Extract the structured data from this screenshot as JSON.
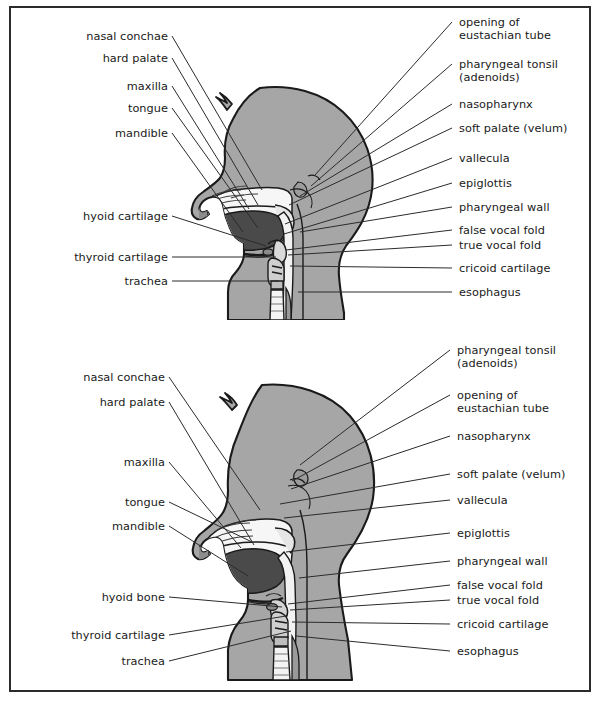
{
  "figure": {
    "type": "anatomical-diagram",
    "title_visible": false,
    "panels": [
      {
        "id": "upper-airway-rest",
        "labels_left": [
          {
            "text": "nasal conchae",
            "x": 57,
            "y": 30,
            "anchor_x": 172,
            "anchor_y": 36,
            "tip_x": 262,
            "tip_y": 190
          },
          {
            "text": "hard palate",
            "x": 80,
            "y": 52,
            "anchor_x": 172,
            "anchor_y": 58,
            "tip_x": 258,
            "tip_y": 205
          },
          {
            "text": "maxilla",
            "x": 100,
            "y": 80,
            "anchor_x": 172,
            "anchor_y": 86,
            "tip_x": 249,
            "tip_y": 209
          },
          {
            "text": "tongue",
            "x": 101,
            "y": 102,
            "anchor_x": 172,
            "anchor_y": 108,
            "tip_x": 258,
            "tip_y": 228
          },
          {
            "text": "mandible",
            "x": 89,
            "y": 127,
            "anchor_x": 172,
            "anchor_y": 133,
            "tip_x": 243,
            "tip_y": 232
          },
          {
            "text": "hyoid cartilage",
            "x": 56,
            "y": 210,
            "anchor_x": 172,
            "anchor_y": 216,
            "tip_x": 266,
            "tip_y": 246
          },
          {
            "text": "thyroid cartilage",
            "x": 44,
            "y": 251,
            "anchor_x": 172,
            "anchor_y": 257,
            "tip_x": 276,
            "tip_y": 257
          },
          {
            "text": "trachea",
            "x": 99,
            "y": 275,
            "anchor_x": 172,
            "anchor_y": 281,
            "tip_x": 279,
            "tip_y": 281
          }
        ],
        "labels_right": [
          {
            "text": "opening of\neustachian tube",
            "x": 459,
            "y": 16,
            "anchor_x": 452,
            "anchor_y": 22,
            "tip_x": 315,
            "tip_y": 175
          },
          {
            "text": "pharyngeal tonsil\n(adenoids)",
            "x": 459,
            "y": 58,
            "anchor_x": 452,
            "anchor_y": 64,
            "tip_x": 311,
            "tip_y": 186
          },
          {
            "text": "nasopharynx",
            "x": 459,
            "y": 98,
            "anchor_x": 452,
            "anchor_y": 104,
            "tip_x": 300,
            "tip_y": 196
          },
          {
            "text": "soft palate (velum)",
            "x": 459,
            "y": 122,
            "anchor_x": 452,
            "anchor_y": 128,
            "tip_x": 289,
            "tip_y": 205
          },
          {
            "text": "vallecula",
            "x": 459,
            "y": 152,
            "anchor_x": 452,
            "anchor_y": 158,
            "tip_x": 285,
            "tip_y": 224
          },
          {
            "text": "epiglottis",
            "x": 459,
            "y": 177,
            "anchor_x": 452,
            "anchor_y": 183,
            "tip_x": 284,
            "tip_y": 234
          },
          {
            "text": "pharyngeal wall",
            "x": 459,
            "y": 201,
            "anchor_x": 452,
            "anchor_y": 207,
            "tip_x": 300,
            "tip_y": 232
          },
          {
            "text": "false vocal fold",
            "x": 459,
            "y": 224,
            "anchor_x": 452,
            "anchor_y": 230,
            "tip_x": 286,
            "tip_y": 250
          },
          {
            "text": "true vocal fold",
            "x": 459,
            "y": 239,
            "anchor_x": 452,
            "anchor_y": 245,
            "tip_x": 288,
            "tip_y": 255
          },
          {
            "text": "cricoid cartilage",
            "x": 459,
            "y": 262,
            "anchor_x": 452,
            "anchor_y": 268,
            "tip_x": 290,
            "tip_y": 266
          },
          {
            "text": "esophagus",
            "x": 459,
            "y": 286,
            "anchor_x": 452,
            "anchor_y": 292,
            "tip_x": 298,
            "tip_y": 292
          }
        ]
      },
      {
        "id": "upper-airway-swallow",
        "labels_left": [
          {
            "text": "nasal conchae",
            "x": 57,
            "y": 51,
            "anchor_x": 169,
            "anchor_y": 57,
            "tip_x": 260,
            "tip_y": 190
          },
          {
            "text": "hard palate",
            "x": 72,
            "y": 76,
            "anchor_x": 169,
            "anchor_y": 82,
            "tip_x": 254,
            "tip_y": 225
          },
          {
            "text": "maxilla",
            "x": 96,
            "y": 136,
            "anchor_x": 169,
            "anchor_y": 142,
            "tip_x": 241,
            "tip_y": 228
          },
          {
            "text": "tongue",
            "x": 96,
            "y": 176,
            "anchor_x": 169,
            "anchor_y": 182,
            "tip_x": 252,
            "tip_y": 222
          },
          {
            "text": "mandible",
            "x": 84,
            "y": 200,
            "anchor_x": 169,
            "anchor_y": 206,
            "tip_x": 248,
            "tip_y": 256
          },
          {
            "text": "hyoid bone",
            "x": 76,
            "y": 271,
            "anchor_x": 169,
            "anchor_y": 277,
            "tip_x": 282,
            "tip_y": 287
          },
          {
            "text": "thyroid cartilage",
            "x": 44,
            "y": 309,
            "anchor_x": 169,
            "anchor_y": 315,
            "tip_x": 286,
            "tip_y": 296
          },
          {
            "text": "trachea",
            "x": 96,
            "y": 335,
            "anchor_x": 169,
            "anchor_y": 341,
            "tip_x": 291,
            "tip_y": 311
          }
        ],
        "labels_right": [
          {
            "text": "pharyngeal tonsil\n(adenoids)",
            "x": 457,
            "y": 24,
            "anchor_x": 450,
            "anchor_y": 30,
            "tip_x": 300,
            "tip_y": 145
          },
          {
            "text": "opening of\neustachian tube",
            "x": 457,
            "y": 69,
            "anchor_x": 450,
            "anchor_y": 75,
            "tip_x": 292,
            "tip_y": 161
          },
          {
            "text": "nasopharynx",
            "x": 457,
            "y": 110,
            "anchor_x": 450,
            "anchor_y": 116,
            "tip_x": 291,
            "tip_y": 169
          },
          {
            "text": "soft palate (velum)",
            "x": 457,
            "y": 148,
            "anchor_x": 450,
            "anchor_y": 154,
            "tip_x": 280,
            "tip_y": 184
          },
          {
            "text": "vallecula",
            "x": 457,
            "y": 174,
            "anchor_x": 450,
            "anchor_y": 180,
            "tip_x": 284,
            "tip_y": 198
          },
          {
            "text": "epiglottis",
            "x": 457,
            "y": 207,
            "anchor_x": 450,
            "anchor_y": 213,
            "tip_x": 286,
            "tip_y": 232
          },
          {
            "text": "pharyngeal wall",
            "x": 457,
            "y": 235,
            "anchor_x": 450,
            "anchor_y": 241,
            "tip_x": 299,
            "tip_y": 258
          },
          {
            "text": "false vocal fold",
            "x": 457,
            "y": 259,
            "anchor_x": 450,
            "anchor_y": 265,
            "tip_x": 288,
            "tip_y": 284
          },
          {
            "text": "true vocal fold",
            "x": 457,
            "y": 274,
            "anchor_x": 450,
            "anchor_y": 280,
            "tip_x": 290,
            "tip_y": 290
          },
          {
            "text": "cricoid cartilage",
            "x": 457,
            "y": 298,
            "anchor_x": 450,
            "anchor_y": 304,
            "tip_x": 292,
            "tip_y": 302
          },
          {
            "text": "esophagus",
            "x": 457,
            "y": 325,
            "anchor_x": 450,
            "anchor_y": 331,
            "tip_x": 296,
            "tip_y": 316
          }
        ]
      }
    ]
  },
  "colors": {
    "page_background": "#ffffff",
    "frame_border": "#2b2b2b",
    "head_fill": "#a6a6a6",
    "head_outline": "#1a1a1a",
    "cavity_light": "#f4f4f4",
    "tongue_dark": "#4a4a4a",
    "tissue_mid": "#8c8c8c",
    "leader_line": "#2b2b2b",
    "label_text": "#1a1a1a"
  }
}
